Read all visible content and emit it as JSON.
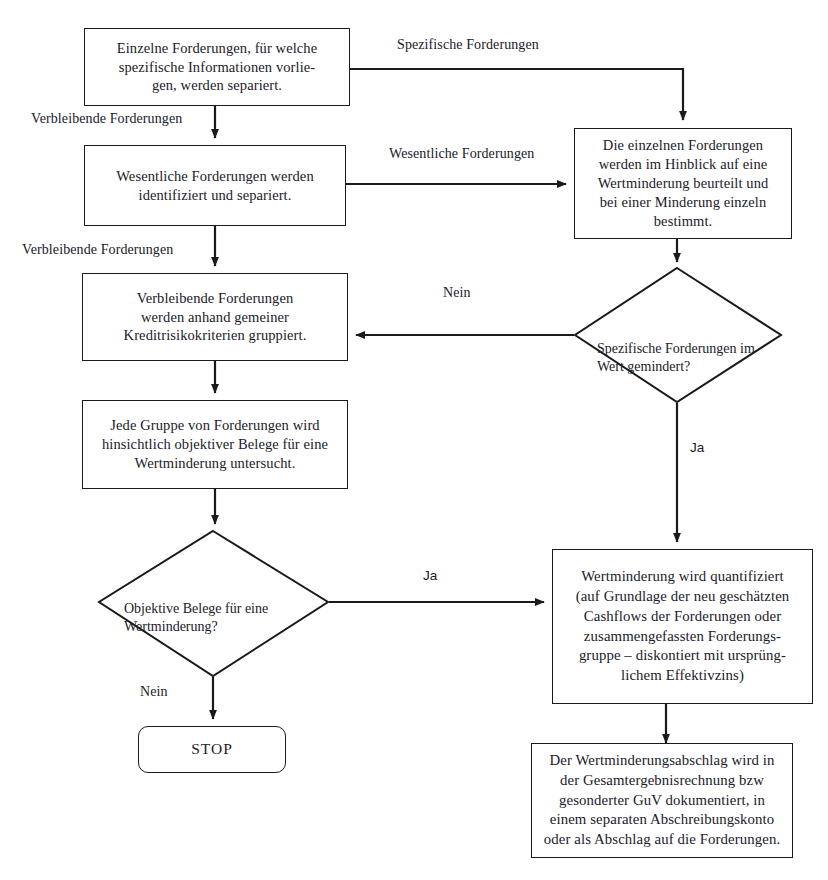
{
  "page": {
    "top_fragment": "",
    "width": 828,
    "height": 880,
    "background": "#ffffff",
    "line_color": "#1a1a1a",
    "text_color": "#20202a"
  },
  "nodes": {
    "box_einzelne": {
      "id": "einzelne-forderungen",
      "shape": "process",
      "text": "Einzelne Forderungen, für welche\nspezifische Informationen vorlie-\ngen, werden separiert."
    },
    "box_wesentliche": {
      "id": "wesentliche-forderungen",
      "shape": "process",
      "text": "Wesentliche Forderungen werden\nidentifiziert und separiert."
    },
    "box_verbleibende": {
      "id": "verbleibende-forderungen",
      "shape": "process",
      "text": "Verbleibende Forderungen\nwerden anhand gemeiner\nKreditrisikokriterien gruppiert."
    },
    "box_jede_gruppe": {
      "id": "jede-gruppe",
      "shape": "process",
      "text": "Jede Gruppe von Forderungen wird\nhinsichtlich objektiver Belege für eine\nWertminderung untersucht."
    },
    "box_die_einzelnen": {
      "id": "die-einzelnen-forderungen",
      "shape": "process",
      "text": "Die einzelnen Forderungen\nwerden im Hinblick auf eine\nWertminderung beurteilt und\nbei einer Minderung einzeln\nbestimmt."
    },
    "box_quantifiziert": {
      "id": "wertminderung-quantifiziert",
      "shape": "process",
      "text": "Wertminderung wird quantifiziert\n(auf Grundlage der neu geschätzten\nCashflows der Forderungen oder\nzusammengefassten Forderungs-\ngruppe – diskontiert mit ursprüng-\nlichem Effektivzins)"
    },
    "box_abschlag": {
      "id": "wertminderungsabschlag",
      "shape": "process",
      "text": "Der Wertminderungsabschlag wird in\nder Gesamtergebnisrechnung bzw\ngesonderter GuV dokumentiert, in\neinem separaten Abschreibungskonto\noder als Abschlag auf die Forderungen."
    },
    "diamond_spezifische": {
      "id": "spezifische-gemindert-decision",
      "shape": "decision",
      "text": "Spezifische Forderungen im\nWert gemindert?"
    },
    "diamond_objektive": {
      "id": "objektive-belege-decision",
      "shape": "decision",
      "text": "Objektive Belege für eine\nWertminderung?"
    },
    "terminator_stop": {
      "id": "stop-terminator",
      "shape": "terminator",
      "text": "STOP"
    }
  },
  "edge_labels": {
    "spezifische_forderungen": "Spezifische Forderungen",
    "verbleibende_1": "Verbleibende Forderungen",
    "wesentliche_forderungen": "Wesentliche Forderungen",
    "verbleibende_2": "Verbleibende Forderungen",
    "nein_spezifische": "Nein",
    "ja_spezifische": "Ja",
    "ja_objektive": "Ja",
    "nein_objektive": "Nein"
  }
}
